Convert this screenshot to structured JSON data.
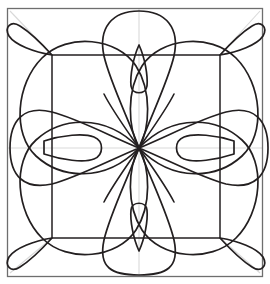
{
  "document": {
    "title": "Floral Quilting Pattern",
    "description": "Eight-fold symmetric floral medallion line drawing inside a square frame",
    "width": 270,
    "height": 284
  },
  "colors": {
    "background": "#ffffff",
    "ink": "#231f20",
    "guide": "#d9d9d9",
    "frame": "#6e6e6e"
  },
  "strokes": {
    "petal_width": 1.7,
    "frame_width": 1.3,
    "inner_square_width": 1.5,
    "guide_width": 1.1
  },
  "geometry": {
    "center": {
      "x": 139,
      "y": 148
    },
    "outer_frame": {
      "x": 7.5,
      "y": 8.5,
      "width": 255,
      "height": 268
    },
    "inner_square": {
      "x": 52,
      "y": 55,
      "width": 168,
      "height": 183
    },
    "guides": {
      "vertical_x": 139,
      "horizontal_y": 148,
      "diagonals": [
        {
          "x1": 10,
          "y1": 11,
          "x2": 52,
          "y2": 55
        },
        {
          "x1": 260,
          "y1": 11,
          "x2": 220,
          "y2": 55
        },
        {
          "x1": 10,
          "y1": 273,
          "x2": 52,
          "y2": 238
        },
        {
          "x1": 260,
          "y1": 273,
          "x2": 220,
          "y2": 238
        }
      ]
    }
  },
  "motifs": {
    "large_petals": {
      "count": 8,
      "note": "Four big rounded lobes on the diagonals plus four tall lobes on the axes, all meeting at the center"
    },
    "small_teardrops": {
      "count": 8,
      "cardinal_note": "Slim teardrops on the vertical axis above and below the center, flatter teardrops on the horizontal axis left and right",
      "diagonal_note": "Narrow pointed teardrops aimed into each of the four corners"
    }
  },
  "chart_data": {
    "type": "line",
    "xlabel": "",
    "ylabel": "",
    "xlim": [
      0,
      270
    ],
    "ylim": [
      0,
      284
    ],
    "grid": false,
    "legend": "none",
    "annotations": [
      "8-fold radial symmetry about center (139, 148)",
      "Outer frame 255 x 268 px",
      "Inner square 168 x 183 px"
    ]
  }
}
